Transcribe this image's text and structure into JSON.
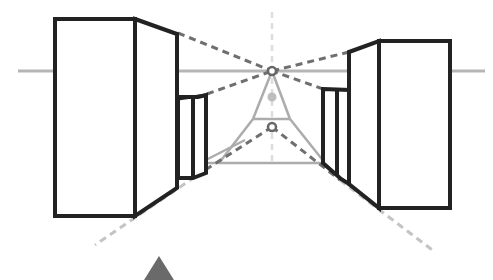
{
  "diagram": {
    "title": "",
    "colors": {
      "outline": "#222222",
      "horizon": "#b5b5b5",
      "guide_dark": "#6f6f6f",
      "guide_light": "#c4c4c4",
      "viewer": "#6a6a6a",
      "background": "#ffffff"
    },
    "horizon_y": 71,
    "vanishing_points": [
      {
        "name": "upper-vp",
        "x": 272,
        "y": 71
      },
      {
        "name": "middle-vp",
        "x": 272,
        "y": 97
      },
      {
        "name": "lower-vp",
        "x": 272,
        "y": 127
      }
    ],
    "elements": [
      {
        "name": "left-large-building"
      },
      {
        "name": "left-small-building"
      },
      {
        "name": "right-large-building"
      },
      {
        "name": "right-small-building"
      },
      {
        "name": "viewer-marker"
      }
    ]
  }
}
